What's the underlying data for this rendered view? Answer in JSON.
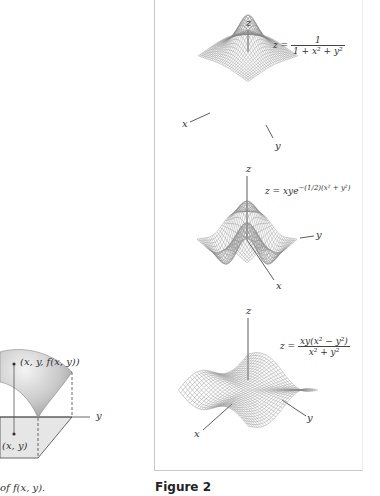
{
  "left_figure": {
    "point_label": "(x, y, f(x, y))",
    "base_label": "(x, y)",
    "axis_y": "y",
    "caption_fragment": "of f(x, y)."
  },
  "figure2": {
    "caption": "Figure 2",
    "plots": [
      {
        "axis_z": "z",
        "axis_x": "x",
        "axis_y": "y",
        "equation_lhs": "z =",
        "equation_num": "1",
        "equation_den": "1 + x² + y²"
      },
      {
        "axis_z": "z",
        "axis_x": "x",
        "axis_y": "y",
        "equation": "z = xye",
        "equation_exp": "−(1/2)(x² + y²)"
      },
      {
        "axis_z": "z",
        "axis_x": "x",
        "axis_y": "y",
        "equation_lhs": "z =",
        "equation_num": "xy(x² − y²)",
        "equation_den": "x² + y²"
      }
    ]
  }
}
